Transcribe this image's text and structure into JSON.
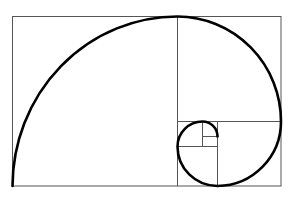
{
  "figure": {
    "type": "golden-spiral-diagram",
    "stroke_color": "#555555",
    "spiral_color": "#000000",
    "caption": ""
  }
}
